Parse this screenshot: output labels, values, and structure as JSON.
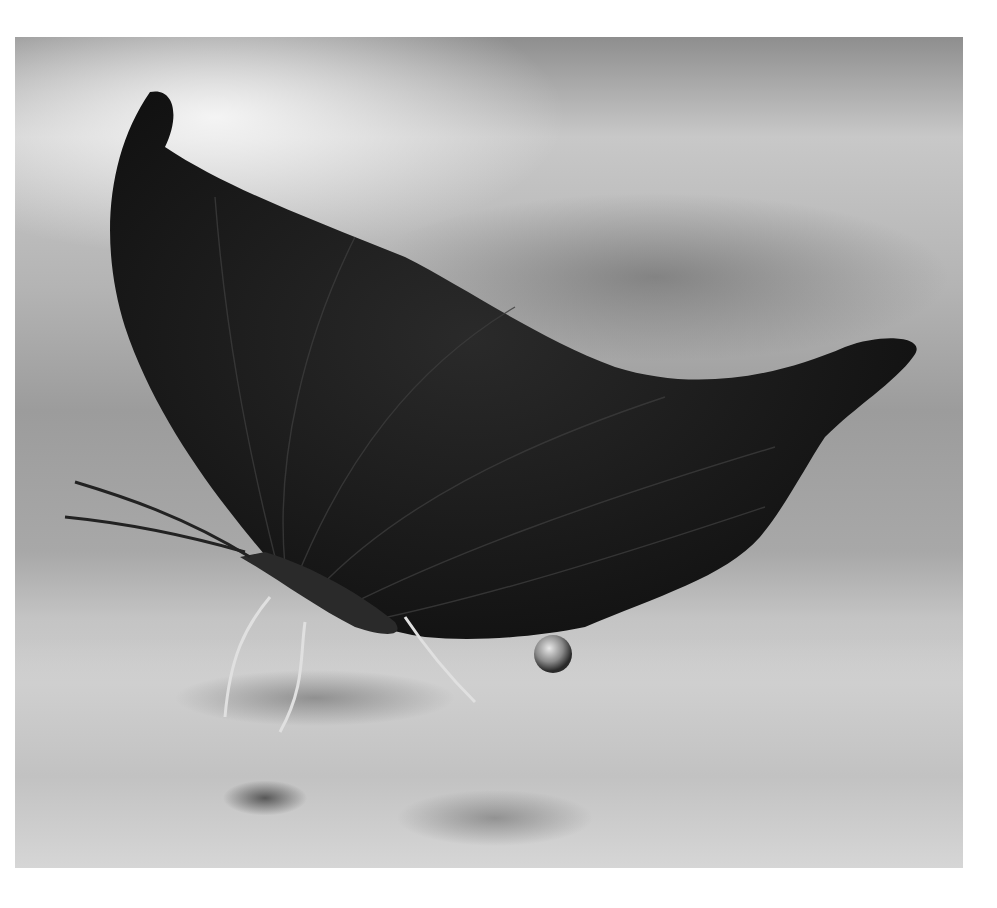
{
  "image": {
    "subject": "butterfly",
    "description": "Grayscale close-up of a dead-leaf butterfly with closed wings drinking from sandy ground, a water droplet hanging beneath its abdomen",
    "colors": {
      "page_background": "#ffffff",
      "wing": "#1a1a1a",
      "background_light": "#cfcfcf",
      "background_dark": "#8e8e8e"
    }
  }
}
